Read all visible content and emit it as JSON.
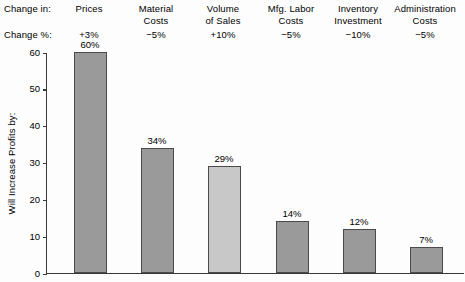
{
  "header": {
    "row1_label": "Change in:",
    "row2_label": "Change %:"
  },
  "axis": {
    "ylabel": "Will Increase Profits by:",
    "yticks": [
      "60",
      "50",
      "40",
      "30",
      "20",
      "10",
      "0"
    ]
  },
  "colors": {
    "bar_default_fill": "#9a9a9a",
    "bar_highlight_fill": "#c8c8c8",
    "bar_stroke": "#4a4a4a",
    "axis": "#3a3a3a",
    "background": "#fdfdfd",
    "text": "#000000"
  },
  "chart_data": {
    "type": "bar",
    "title": "",
    "xlabel": "",
    "ylabel": "Will Increase Profits by:",
    "ylim": [
      0,
      60
    ],
    "ytick_step": 10,
    "grid": false,
    "legend": "none",
    "categories": [
      "Prices",
      "Material\nCosts",
      "Volume\nof Sales",
      "Mfg. Labor\nCosts",
      "Inventory\nInvestment",
      "Administration\nCosts"
    ],
    "change_pct": [
      "+3%",
      "−5%",
      "+10%",
      "−5%",
      "−10%",
      "−5%"
    ],
    "values": [
      60,
      34,
      29,
      14,
      12,
      7
    ],
    "value_labels": [
      "60%",
      "34%",
      "29%",
      "14%",
      "12%",
      "7%"
    ],
    "highlight_index": 2
  }
}
